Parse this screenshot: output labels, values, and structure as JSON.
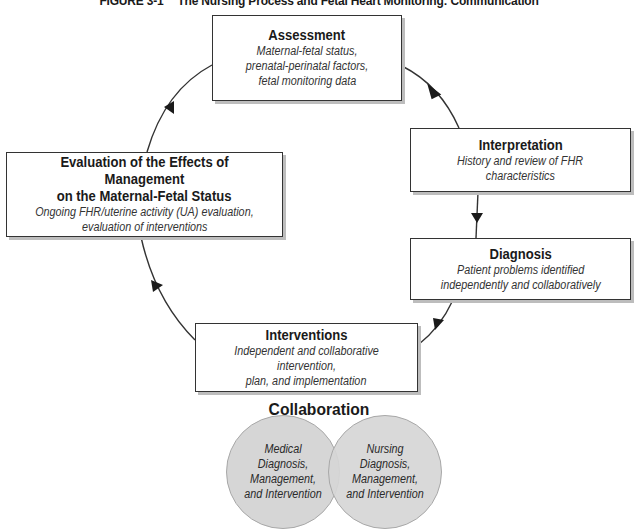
{
  "figure": {
    "label": "FIGURE 3-1",
    "title": "The Nursing Process and Fetal Heart Monitoring: Communication"
  },
  "cycle": {
    "assessment": {
      "heading": "Assessment",
      "detail": "Maternal-fetal status, prenatal-perinatal factors, fetal monitoring data",
      "lines": [
        "Maternal-fetal status,",
        "prenatal-perinatal factors,",
        "fetal monitoring data"
      ]
    },
    "interpretation": {
      "heading": "Interpretation",
      "lines": [
        "History and review of FHR",
        "characteristics"
      ]
    },
    "diagnosis": {
      "heading": "Diagnosis",
      "lines": [
        "Patient problems identified",
        "independently and collaboratively"
      ]
    },
    "interventions": {
      "heading": "Interventions",
      "lines": [
        "Independent and collaborative intervention,",
        "plan, and implementation"
      ]
    },
    "evaluation": {
      "heading_lines": [
        "Evaluation of the Effects of Management",
        "on the Maternal-Fetal Status"
      ],
      "lines": [
        "Ongoing FHR/uterine activity (UA) evaluation,",
        "evaluation of interventions"
      ]
    }
  },
  "flow": [
    "Assessment",
    "Interpretation",
    "Diagnosis",
    "Interventions",
    "Evaluation of the Effects of Management on the Maternal-Fetal Status",
    "Assessment"
  ],
  "collaboration": {
    "title": "Collaboration",
    "circles": [
      {
        "label": "Medical\nDiagnosis,\nManagement,\nand Intervention"
      },
      {
        "label": "Nursing\nDiagnosis,\nManagement,\nand Intervention"
      }
    ]
  },
  "colors": {
    "line": "#333333",
    "box_shadow": "#bdbdbd",
    "circle_fill": "#d6d6d6",
    "circle_border": "#a8a8a8"
  }
}
